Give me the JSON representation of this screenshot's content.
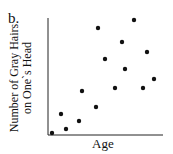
{
  "panel_label": "b.",
  "chart_data": {
    "type": "scatter",
    "title": "",
    "xlabel": "Age",
    "ylabel": "Number of Gray Hairs on One's Head",
    "ylabel_lines": [
      "Number of Gray Hairs",
      "on One`s Head"
    ],
    "grid": false,
    "legend": null,
    "x_ticks": [],
    "y_ticks": [],
    "points_pixel": [
      {
        "x": 52,
        "y": 133
      },
      {
        "x": 61,
        "y": 114
      },
      {
        "x": 66,
        "y": 129
      },
      {
        "x": 79,
        "y": 121
      },
      {
        "x": 82,
        "y": 91
      },
      {
        "x": 96,
        "y": 107
      },
      {
        "x": 98,
        "y": 28
      },
      {
        "x": 105,
        "y": 59
      },
      {
        "x": 115,
        "y": 88
      },
      {
        "x": 122,
        "y": 42
      },
      {
        "x": 125,
        "y": 69
      },
      {
        "x": 134,
        "y": 20
      },
      {
        "x": 143,
        "y": 88
      },
      {
        "x": 147,
        "y": 52
      },
      {
        "x": 154,
        "y": 79
      }
    ],
    "points": [
      {
        "x": 3,
        "y": 2
      },
      {
        "x": 11,
        "y": 18
      },
      {
        "x": 16,
        "y": 5
      },
      {
        "x": 27,
        "y": 12
      },
      {
        "x": 30,
        "y": 38
      },
      {
        "x": 42,
        "y": 24
      },
      {
        "x": 43,
        "y": 93
      },
      {
        "x": 50,
        "y": 66
      },
      {
        "x": 58,
        "y": 41
      },
      {
        "x": 64,
        "y": 81
      },
      {
        "x": 67,
        "y": 57
      },
      {
        "x": 75,
        "y": 100
      },
      {
        "x": 83,
        "y": 41
      },
      {
        "x": 86,
        "y": 72
      },
      {
        "x": 92,
        "y": 49
      }
    ],
    "xlim": [
      0,
      100
    ],
    "ylim": [
      0,
      100
    ],
    "relationship": "positive correlation"
  }
}
